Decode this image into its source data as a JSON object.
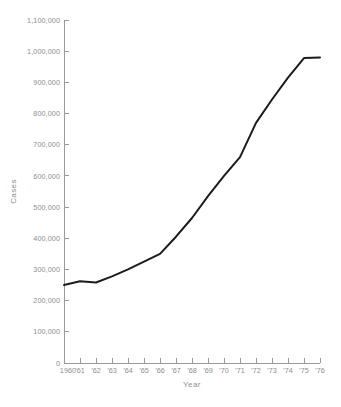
{
  "chart_data": {
    "type": "line",
    "title": "",
    "xlabel": "Year",
    "ylabel": "Cases",
    "grid": false,
    "legend": "none",
    "line_color": "#1c1c1c",
    "axis_color": "#9a9a9a",
    "label_color": "#8d8d8d",
    "background": "#ffffff",
    "x": [
      1960,
      1961,
      1962,
      1963,
      1964,
      1965,
      1966,
      1967,
      1968,
      1969,
      1970,
      1971,
      1972,
      1973,
      1974,
      1975,
      1976
    ],
    "categories": [
      "1960",
      "'61",
      "'62",
      "'63",
      "'64",
      "'65",
      "'66",
      "'67",
      "'68",
      "'69",
      "'70",
      "'71",
      "'72",
      "'73",
      "'74",
      "'75",
      "'76"
    ],
    "values": [
      250000,
      262000,
      258000,
      278000,
      300000,
      325000,
      350000,
      405000,
      465000,
      535000,
      600000,
      660000,
      770000,
      845000,
      915000,
      978000,
      980000
    ],
    "xlim": [
      1960,
      1976
    ],
    "ylim": [
      0,
      1100000
    ],
    "ytick_values": [
      0,
      100000,
      200000,
      300000,
      400000,
      500000,
      600000,
      700000,
      800000,
      900000,
      1000000,
      1100000
    ],
    "ytick_labels": [
      "0",
      "100,000",
      "200,000",
      "300,000",
      "400,000",
      "500,000",
      "600,000",
      "700,000",
      "800,000",
      "900,000",
      "1,000,000",
      "1,100,000"
    ]
  }
}
